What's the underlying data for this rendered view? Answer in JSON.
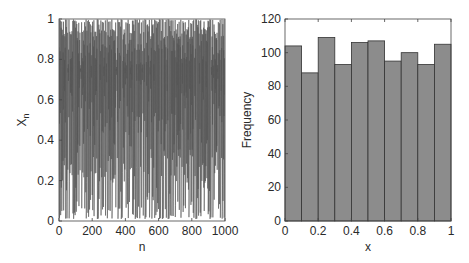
{
  "chart_data": [
    {
      "type": "line",
      "title": "",
      "xlabel": "n",
      "ylabel": "X_n",
      "ylabel_main": "X",
      "ylabel_sub": "n",
      "xlim": [
        0,
        1000
      ],
      "ylim": [
        0,
        1
      ],
      "xticks": [
        "0",
        "200",
        "400",
        "600",
        "800",
        "1000"
      ],
      "yticks": [
        "0",
        "0.2",
        "0.4",
        "0.6",
        "0.8",
        "1"
      ],
      "series": [
        {
          "name": "X_n",
          "n_points": 1000,
          "description": "chaotic sequence uniformly spread over [0,1]",
          "color": "#555555"
        }
      ],
      "grid": false,
      "legend": null
    },
    {
      "type": "bar",
      "title": "",
      "xlabel": "x",
      "ylabel": "Frequency",
      "xlim": [
        0,
        1
      ],
      "ylim": [
        0,
        120
      ],
      "xticks": [
        "0",
        "0.2",
        "0.4",
        "0.6",
        "0.8",
        "1"
      ],
      "yticks": [
        "0",
        "20",
        "40",
        "60",
        "80",
        "100",
        "120"
      ],
      "categories": [
        "0-0.1",
        "0.1-0.2",
        "0.2-0.3",
        "0.3-0.4",
        "0.4-0.5",
        "0.5-0.6",
        "0.6-0.7",
        "0.7-0.8",
        "0.8-0.9",
        "0.9-1"
      ],
      "values": [
        104,
        88,
        109,
        93,
        106,
        107,
        95,
        100,
        93,
        105
      ],
      "bar_color": "#8c8c8c",
      "edge_color": "#333333",
      "grid": false,
      "legend": null
    }
  ]
}
